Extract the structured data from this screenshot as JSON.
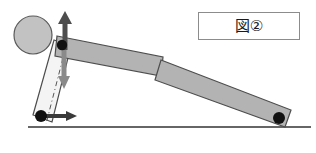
{
  "figure": {
    "caption_box": {
      "text": "図②",
      "figure_word": "図",
      "figure_number": "②",
      "border_color": "#8c8c8c",
      "background_color": "#ffffff"
    },
    "colors": {
      "arm_fill": "#b3b3b3",
      "arm_stroke": "#4d4d4d",
      "link_fill": "#f2f2f2",
      "link_stroke": "#4d4d4d",
      "wheel_fill": "#c2c2c2",
      "wheel_stroke": "#5a5a5a",
      "pivot_dot": "#111111",
      "ground_line": "#333333",
      "arrow_up": "#4d4d4d",
      "arrow_down": "#8a8a8a",
      "arrow_horizontal": "#3a3a3a",
      "dash_line": "#555555"
    },
    "parts": [
      {
        "name": "wheel",
        "cx": 33,
        "cy": 35,
        "r": 19
      },
      {
        "name": "upper-pivot",
        "cx": 62,
        "cy": 45,
        "r": 5
      },
      {
        "name": "lower-pivot",
        "cx": 41,
        "cy": 116,
        "r": 6
      },
      {
        "name": "end-pivot",
        "cx": 279,
        "cy": 118,
        "r": 6
      }
    ],
    "arrows": [
      {
        "name": "upward-force-arrow",
        "x": 65,
        "y_from": 52,
        "y_to": 13
      },
      {
        "name": "downward-force-arrow",
        "x": 64,
        "y_from": 50,
        "y_to": 86
      },
      {
        "name": "horizontal-force-arrow",
        "y": 116,
        "x_from": 44,
        "x_to": 75
      }
    ],
    "ground": {
      "x_from": 28,
      "x_to": 311,
      "y": 127
    },
    "reference_line": {
      "x_top": 63,
      "y_top": 40,
      "x_bottom": 45,
      "y_bottom": 122
    }
  }
}
